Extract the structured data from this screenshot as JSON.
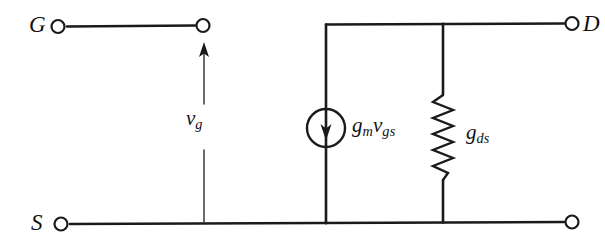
{
  "figure": {
    "name": "small-signal-fet-equivalent-circuit",
    "background_color": "#ffffff",
    "line_color": "#1a1a1a",
    "width": 605,
    "height": 249
  },
  "terminals": {
    "gate": {
      "label": "G",
      "symbol": "open-circle",
      "x": 58,
      "y": 26
    },
    "drain": {
      "label": "D",
      "symbol": "open-circle",
      "x": 572,
      "y": 24
    },
    "source": {
      "label": "S",
      "symbol": "open-circle",
      "x": 61,
      "y": 224
    },
    "source_right": {
      "label": "",
      "symbol": "open-circle",
      "x": 572,
      "y": 222
    },
    "gate_node": {
      "label": "",
      "symbol": "open-circle",
      "x": 203,
      "y": 25
    }
  },
  "components": {
    "current_source": {
      "label_main": "g",
      "label_sub1": "m",
      "label_main2": "v",
      "label_sub2": "gs",
      "label_plain": "gmvgs",
      "symbol": "circle-with-down-arrow",
      "arrow_direction": "down",
      "cx": 326,
      "cy": 128,
      "radius": 19
    },
    "conductance": {
      "label_main": "g",
      "label_sub": "ds",
      "label_plain": "gds",
      "symbol": "zigzag-resistor",
      "x": 443,
      "y_top": 95,
      "y_bottom": 180
    },
    "gate_voltage_arrow": {
      "label_main": "v",
      "label_sub": "g",
      "label_plain": "vg",
      "symbol": "up-arrow",
      "arrow_direction": "up",
      "x": 204,
      "y_tail": 222,
      "y_head": 45
    }
  },
  "wires": {
    "gate_branch": "horizontal wire from G terminal to gate node",
    "top_rail": "horizontal wire from current source branch to D terminal",
    "bottom_rail": "horizontal wire from S terminal to right terminal",
    "source_branch": "vertical wire at x=326 from top rail to bottom rail",
    "conductance_branch": "vertical wire at x=443 from top rail to bottom rail"
  }
}
